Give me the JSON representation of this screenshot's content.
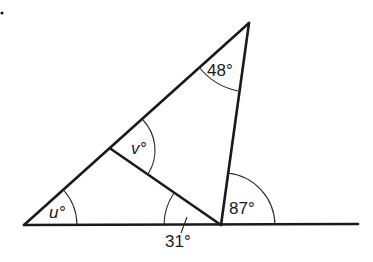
{
  "diagram": {
    "type": "geometry-triangle-angles",
    "labels": {
      "top_angle": "48°",
      "inner_angle_v": "v°",
      "base_left_angle_u": "u°",
      "base_inner_angle": "31°",
      "exterior_angle": "87°"
    },
    "vertices": {
      "left": [
        24,
        225
      ],
      "top": [
        249,
        23
      ],
      "bottom_right": [
        221,
        225
      ],
      "mid_left_side": [
        111,
        149
      ]
    },
    "colors": {
      "line": "#1a1a1a",
      "background": "#ffffff"
    }
  }
}
